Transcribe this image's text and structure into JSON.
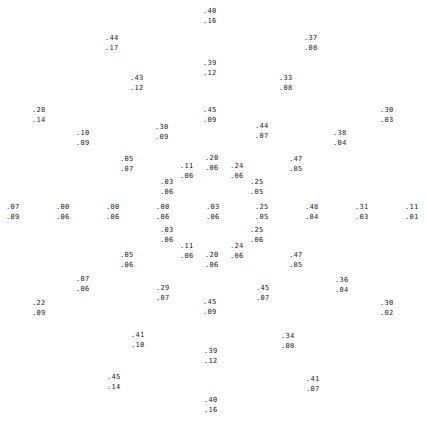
{
  "points": [
    {
      "x": 203,
      "y": 6,
      "a": ".40",
      "b": ".16"
    },
    {
      "x": 105,
      "y": 33,
      "a": ".44",
      "b": ".17"
    },
    {
      "x": 304,
      "y": 33,
      "a": ".37",
      "b": ".08"
    },
    {
      "x": 203,
      "y": 58,
      "a": ".39",
      "b": ".12"
    },
    {
      "x": 130,
      "y": 73,
      "a": ".43",
      "b": ".12"
    },
    {
      "x": 279,
      "y": 73,
      "a": ".33",
      "b": ".08"
    },
    {
      "x": 32,
      "y": 105,
      "a": ".28",
      "b": ".14"
    },
    {
      "x": 203,
      "y": 105,
      "a": ".45",
      "b": ".09"
    },
    {
      "x": 380,
      "y": 105,
      "a": ".30",
      "b": ".03"
    },
    {
      "x": 155,
      "y": 122,
      "a": ".30",
      "b": ".09"
    },
    {
      "x": 255,
      "y": 121,
      "a": ".44",
      "b": ".07"
    },
    {
      "x": 76,
      "y": 128,
      "a": ".10",
      "b": ".09"
    },
    {
      "x": 333,
      "y": 128,
      "a": ".38",
      "b": ".04"
    },
    {
      "x": 120,
      "y": 154,
      "a": ".05",
      "b": ".07"
    },
    {
      "x": 289,
      "y": 154,
      "a": ".47",
      "b": ".05"
    },
    {
      "x": 205,
      "y": 153,
      "a": ".20",
      "b": ".06"
    },
    {
      "x": 180,
      "y": 161,
      "a": ".11",
      "b": ".06"
    },
    {
      "x": 230,
      "y": 161,
      "a": ".24",
      "b": ".06"
    },
    {
      "x": 160,
      "y": 177,
      "a": ".03",
      "b": ".06"
    },
    {
      "x": 250,
      "y": 177,
      "a": ".25",
      "b": ".05"
    },
    {
      "x": 6,
      "y": 202,
      "a": ".07",
      "b": ".09"
    },
    {
      "x": 56,
      "y": 202,
      "a": ".00",
      "b": ".06"
    },
    {
      "x": 106,
      "y": 202,
      "a": ".00",
      "b": ".06"
    },
    {
      "x": 156,
      "y": 202,
      "a": ".00",
      "b": ".06"
    },
    {
      "x": 206,
      "y": 202,
      "a": ".03",
      "b": ".06"
    },
    {
      "x": 255,
      "y": 202,
      "a": ".25",
      "b": ".05"
    },
    {
      "x": 305,
      "y": 202,
      "a": ".48",
      "b": ".04"
    },
    {
      "x": 355,
      "y": 202,
      "a": ".31",
      "b": ".03"
    },
    {
      "x": 405,
      "y": 202,
      "a": ".11",
      "b": ".01"
    },
    {
      "x": 160,
      "y": 225,
      "a": ".03",
      "b": ".06"
    },
    {
      "x": 250,
      "y": 225,
      "a": ".25",
      "b": ".06"
    },
    {
      "x": 180,
      "y": 241,
      "a": ".11",
      "b": ".06"
    },
    {
      "x": 230,
      "y": 241,
      "a": ".24",
      "b": ".06"
    },
    {
      "x": 205,
      "y": 250,
      "a": ".20",
      "b": ".06"
    },
    {
      "x": 120,
      "y": 250,
      "a": ".05",
      "b": ".06"
    },
    {
      "x": 289,
      "y": 250,
      "a": ".47",
      "b": ".05"
    },
    {
      "x": 76,
      "y": 274,
      "a": ".07",
      "b": ".06"
    },
    {
      "x": 335,
      "y": 275,
      "a": ".36",
      "b": ".04"
    },
    {
      "x": 156,
      "y": 283,
      "a": ".29",
      "b": ".07"
    },
    {
      "x": 256,
      "y": 283,
      "a": ".45",
      "b": ".07"
    },
    {
      "x": 203,
      "y": 297,
      "a": ".45",
      "b": ".09"
    },
    {
      "x": 32,
      "y": 298,
      "a": ".22",
      "b": ".09"
    },
    {
      "x": 380,
      "y": 298,
      "a": ".30",
      "b": ".02"
    },
    {
      "x": 131,
      "y": 330,
      "a": ".41",
      "b": ".10"
    },
    {
      "x": 281,
      "y": 331,
      "a": ".34",
      "b": ".08"
    },
    {
      "x": 204,
      "y": 346,
      "a": ".39",
      "b": ".12"
    },
    {
      "x": 107,
      "y": 372,
      "a": ".45",
      "b": ".14"
    },
    {
      "x": 306,
      "y": 374,
      "a": ".41",
      "b": ".07"
    },
    {
      "x": 204,
      "y": 395,
      "a": ".40",
      "b": ".16"
    }
  ]
}
